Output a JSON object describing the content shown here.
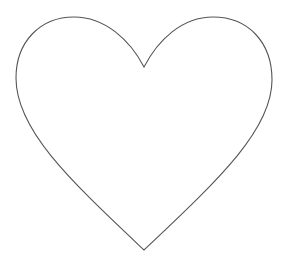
{
  "image": {
    "subject": "heart outline",
    "background_color": "#ffffff",
    "stroke_color": "#555555",
    "fill_color": "#ffffff"
  }
}
